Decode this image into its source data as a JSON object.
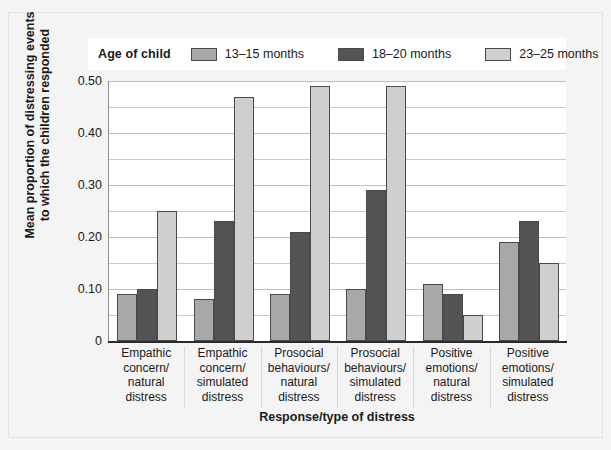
{
  "chart_data": {
    "type": "bar",
    "title": "",
    "xlabel": "Response/type of distress",
    "ylabel": "Mean proportion of distressing events to which the children responded",
    "ylim": [
      0,
      0.5
    ],
    "ytick_labels": [
      "0",
      "0.10",
      "0.20",
      "0.30",
      "0.40",
      "0.50"
    ],
    "ytick_values": [
      0,
      0.1,
      0.2,
      0.3,
      0.4,
      0.5
    ],
    "gridline_values": [
      0.05,
      0.1,
      0.15,
      0.2,
      0.25,
      0.3,
      0.35,
      0.4,
      0.45,
      0.5
    ],
    "grid": true,
    "legend_position": "top",
    "legend_title": "Age of child",
    "categories": [
      "Empathic concern/ natural distress",
      "Empathic concern/ simulated distress",
      "Prosocial behaviours/ natural distress",
      "Prosocial behaviours/ simulated distress",
      "Positive emotions/ natural distress",
      "Positive emotions/ simulated distress"
    ],
    "category_lines": [
      [
        "Empathic",
        "concern/",
        "natural",
        "distress"
      ],
      [
        "Empathic",
        "concern/",
        "simulated",
        "distress"
      ],
      [
        "Prosocial",
        "behaviours/",
        "natural",
        "distress"
      ],
      [
        "Prosocial",
        "behaviours/",
        "simulated",
        "distress"
      ],
      [
        "Positive",
        "emotions/",
        "natural",
        "distress"
      ],
      [
        "Positive",
        "emotions/",
        "simulated",
        "distress"
      ]
    ],
    "series": [
      {
        "name": "13–15 months",
        "color": "#a8a8a8",
        "values": [
          0.09,
          0.08,
          0.09,
          0.1,
          0.11,
          0.19
        ]
      },
      {
        "name": "18–20 months",
        "color": "#545454",
        "values": [
          0.1,
          0.23,
          0.21,
          0.29,
          0.09,
          0.23
        ]
      },
      {
        "name": "23–25 months",
        "color": "#cfcfcf",
        "values": [
          0.25,
          0.47,
          0.49,
          0.49,
          0.05,
          0.15
        ]
      }
    ]
  },
  "figure": {
    "background": "#f4f4f4",
    "plot_background": "#ffffff",
    "axis_color": "#2b2b2b",
    "grid_color": "#c9c9c9"
  }
}
